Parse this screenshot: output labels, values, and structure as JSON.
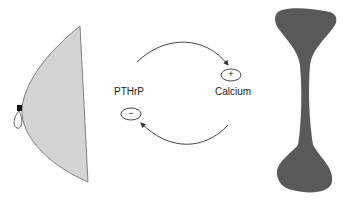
{
  "diagram": {
    "labels": {
      "left": "PTHrP",
      "right": "Calcium"
    },
    "signs": {
      "positive": "+",
      "negative": "−"
    },
    "colors": {
      "breast_fill": "#d4d4d4",
      "bone_fill": "#595959",
      "line": "#333333"
    },
    "arrows": [
      {
        "from": "PTHrP",
        "to": "Calcium",
        "effect": "positive"
      },
      {
        "from": "Calcium",
        "to": "PTHrP",
        "effect": "negative"
      }
    ]
  }
}
